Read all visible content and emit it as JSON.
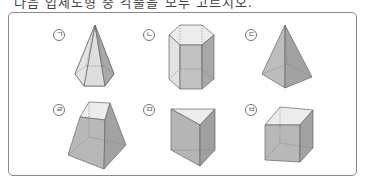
{
  "header": {
    "clipped_text": "다음 입체도형 중 각뿔을 모두 고르시오."
  },
  "figures": [
    {
      "label": "ㄱ",
      "shape": "hexagonal-pyramid"
    },
    {
      "label": "ㄴ",
      "shape": "hexagonal-prism"
    },
    {
      "label": "ㄷ",
      "shape": "square-pyramid"
    },
    {
      "label": "ㄹ",
      "shape": "square-frustum"
    },
    {
      "label": "ㅁ",
      "shape": "triangular-prism"
    },
    {
      "label": "ㅂ",
      "shape": "cube"
    }
  ],
  "colors": {
    "border": "#8a8a8a",
    "face_light": "#e6e6e6",
    "face_mid": "#c8c8c8",
    "face_dark": "#a8a8a8",
    "edge": "#666666"
  }
}
